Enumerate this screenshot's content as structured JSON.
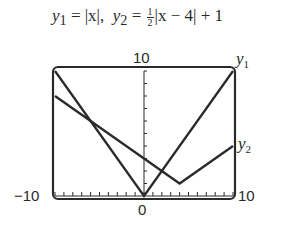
{
  "equation": {
    "y1_name": "y",
    "y1_sub": "1",
    "y1_expr": " = |x|,  ",
    "y2_name": "y",
    "y2_sub": "2",
    "y2_eq": " = ",
    "y2_frac_num": "1",
    "y2_frac_den": "2",
    "y2_rest": "|x − 4| + 1"
  },
  "axis_labels": {
    "ymax": "10",
    "xmin": "−10",
    "xmax": "10",
    "origin": "0"
  },
  "series_labels": {
    "y1": {
      "name": "y",
      "sub": "1"
    },
    "y2": {
      "name": "y",
      "sub": "2"
    }
  },
  "chart_data": {
    "type": "line",
    "xlabel": "",
    "ylabel": "",
    "xlim": [
      -10,
      10
    ],
    "ylim": [
      0,
      10
    ],
    "grid": false,
    "x_ticks_step": 1,
    "y_ticks_step": 1,
    "tick_labels": {
      "x": [
        "-10",
        "0",
        "10"
      ],
      "y": [
        "10"
      ]
    },
    "series": [
      {
        "name": "y1",
        "expression": "|x|",
        "x": [
          -10,
          0,
          10
        ],
        "y": [
          10,
          0,
          10
        ]
      },
      {
        "name": "y2",
        "expression": "1/2|x - 4| + 1",
        "x": [
          -10,
          4,
          10
        ],
        "y": [
          8,
          1,
          4
        ]
      }
    ],
    "legend": "inline labels at right end of each curve",
    "color": "#2a2a2a"
  }
}
